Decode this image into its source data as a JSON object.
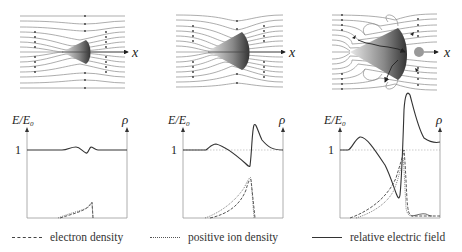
{
  "panels": [
    {
      "id": "early",
      "field_map": {
        "axis_label": "x",
        "cone": "small",
        "field_distortion": "weak"
      },
      "plot": {
        "ylabel_num": "E",
        "ylabel_den": "E",
        "ylabel_sub": "0",
        "xlabel": "ρ",
        "tick_1": "1"
      }
    },
    {
      "id": "middle",
      "field_map": {
        "axis_label": "x",
        "cone": "medium",
        "field_distortion": "moderate"
      },
      "plot": {
        "ylabel_num": "E",
        "ylabel_den": "E",
        "ylabel_sub": "0",
        "xlabel": "ρ",
        "tick_1": "1"
      }
    },
    {
      "id": "late",
      "field_map": {
        "axis_label": "x",
        "cone": "large",
        "field_distortion": "strong",
        "secondary_blob": true
      },
      "plot": {
        "ylabel_num": "E",
        "ylabel_den": "E",
        "ylabel_sub": "0",
        "xlabel": "ρ",
        "tick_1": "1"
      }
    }
  ],
  "legend": {
    "electron_density": "electron density",
    "positive_ion_density": "positive ion density",
    "relative_electric_field": "relative electric field"
  },
  "colors": {
    "ink": "#222222",
    "line": "#555555",
    "field_line": "#8a8a8a",
    "axis": "#999999"
  }
}
